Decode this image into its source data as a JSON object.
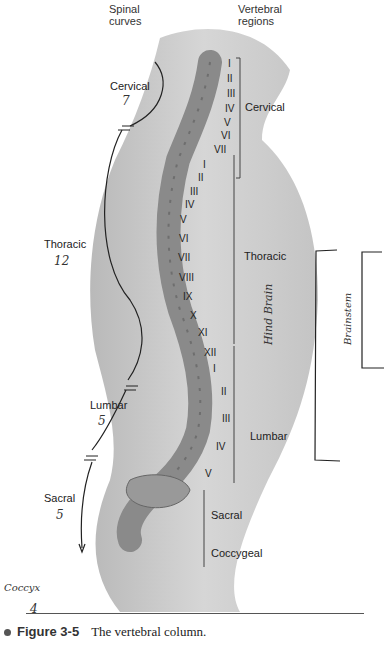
{
  "headers": {
    "spinal_curves": [
      "Spinal",
      "curves"
    ],
    "vertebral_regions": [
      "Vertebral",
      "regions"
    ]
  },
  "spinal_curves": [
    {
      "label": "Cervical",
      "count": "7"
    },
    {
      "label": "Thoracic",
      "count": "12"
    },
    {
      "label": "Lumbar",
      "count": "5"
    },
    {
      "label": "Sacral",
      "count": "5"
    }
  ],
  "handwritten": {
    "coccyx_label": "Coccyx",
    "coccyx_count": "4",
    "hind_brain": "Hind Brain",
    "brain_stem": "Brainstem"
  },
  "vertebral_regions": {
    "cervical": {
      "label": "Cervical",
      "numbers": [
        "I",
        "II",
        "III",
        "IV",
        "V",
        "VI",
        "VII"
      ]
    },
    "thoracic": {
      "label": "Thoracic",
      "numbers": [
        "I",
        "II",
        "III",
        "IV",
        "V",
        "VI",
        "VII",
        "VIII",
        "IX",
        "X",
        "XI",
        "XII"
      ]
    },
    "lumbar": {
      "label": "Lumbar",
      "numbers": [
        "I",
        "II",
        "III",
        "IV",
        "V"
      ]
    },
    "sacral": {
      "label": "Sacral"
    },
    "coccygeal": {
      "label": "Coccygeal"
    }
  },
  "caption": {
    "figure": "Figure 3-5",
    "text": "The vertebral column."
  }
}
